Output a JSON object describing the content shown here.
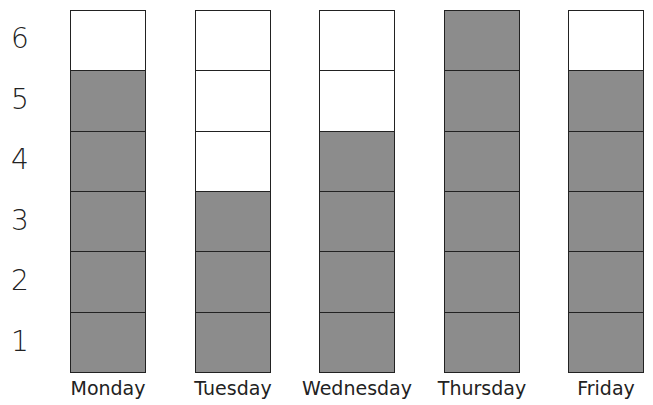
{
  "chart_data": {
    "type": "bar",
    "title": "",
    "xlabel": "",
    "ylabel": "",
    "categories": [
      "Monday",
      "Tuesday",
      "Wednesday",
      "Thursday",
      "Friday"
    ],
    "values": [
      5,
      3,
      4,
      6,
      5
    ],
    "yticks": [
      "1",
      "2",
      "3",
      "4",
      "5",
      "6"
    ],
    "ylim": [
      0,
      6
    ],
    "grid": true,
    "legend": null,
    "fill_color": "#8c8c8c",
    "empty_color": "#ffffff"
  }
}
